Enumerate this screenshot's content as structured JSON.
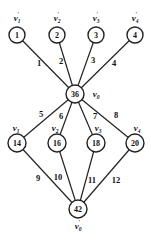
{
  "diagram": {
    "type": "graph",
    "nodes": [
      {
        "id": "n1",
        "value": "1",
        "label": "v",
        "sub": "1",
        "prime": true,
        "x": 17,
        "y": 35,
        "lx": 17,
        "ly": 18
      },
      {
        "id": "n2",
        "value": "2",
        "label": "v",
        "sub": "2",
        "prime": true,
        "x": 57,
        "y": 35,
        "lx": 57,
        "ly": 18
      },
      {
        "id": "n3",
        "value": "3",
        "label": "v",
        "sub": "3",
        "prime": true,
        "x": 96,
        "y": 35,
        "lx": 96,
        "ly": 18
      },
      {
        "id": "n4",
        "value": "4",
        "label": "v",
        "sub": "4",
        "prime": true,
        "x": 135,
        "y": 35,
        "lx": 135,
        "ly": 18
      },
      {
        "id": "n0",
        "value": "36",
        "label": "v",
        "sub": "0",
        "prime": false,
        "x": 75,
        "y": 94,
        "lx": 96,
        "ly": 94
      },
      {
        "id": "m1",
        "value": "14",
        "label": "v",
        "sub": "1",
        "prime": false,
        "x": 17,
        "y": 143,
        "lx": 16,
        "ly": 128
      },
      {
        "id": "m2",
        "value": "16",
        "label": "v",
        "sub": "2",
        "prime": false,
        "x": 57,
        "y": 143,
        "lx": 55,
        "ly": 128
      },
      {
        "id": "m3",
        "value": "18",
        "label": "v",
        "sub": "3",
        "prime": false,
        "x": 96,
        "y": 143,
        "lx": 98,
        "ly": 128
      },
      {
        "id": "m4",
        "value": "20",
        "label": "v",
        "sub": "4",
        "prime": false,
        "x": 135,
        "y": 143,
        "lx": 137,
        "ly": 128
      },
      {
        "id": "b0",
        "value": "42",
        "label": "v",
        "sub": "0",
        "prime": true,
        "x": 78,
        "y": 209,
        "lx": 78,
        "ly": 226
      }
    ],
    "edges": [
      {
        "from": "n1",
        "to": "n0",
        "label": "1",
        "lx": 39,
        "ly": 63
      },
      {
        "from": "n2",
        "to": "n0",
        "label": "2",
        "lx": 61,
        "ly": 61
      },
      {
        "from": "n3",
        "to": "n0",
        "label": "3",
        "lx": 93,
        "ly": 60
      },
      {
        "from": "n4",
        "to": "n0",
        "label": "4",
        "lx": 114,
        "ly": 63
      },
      {
        "from": "n0",
        "to": "m1",
        "label": "5",
        "lx": 41,
        "ly": 114
      },
      {
        "from": "n0",
        "to": "m2",
        "label": "6",
        "lx": 61,
        "ly": 116
      },
      {
        "from": "n0",
        "to": "m3",
        "label": "7",
        "lx": 95,
        "ly": 116
      },
      {
        "from": "n0",
        "to": "m4",
        "label": "8",
        "lx": 116,
        "ly": 115
      },
      {
        "from": "m1",
        "to": "b0",
        "label": "9",
        "lx": 38,
        "ly": 178
      },
      {
        "from": "m2",
        "to": "b0",
        "label": "10",
        "lx": 58,
        "ly": 177
      },
      {
        "from": "m3",
        "to": "b0",
        "label": "11",
        "lx": 92,
        "ly": 180
      },
      {
        "from": "m4",
        "to": "b0",
        "label": "12",
        "lx": 116,
        "ly": 180
      }
    ]
  }
}
